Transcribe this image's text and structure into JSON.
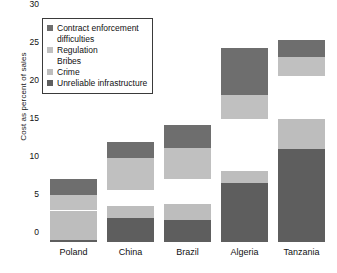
{
  "chart_data": {
    "type": "bar",
    "subtype": "stacked-bar",
    "title": "",
    "xlabel": "",
    "ylabel": "Cost as percent of sales",
    "ylim": [
      0,
      30
    ],
    "yticks": [
      0,
      5,
      10,
      15,
      20,
      25,
      30
    ],
    "grid": false,
    "legend_position": "upper-left-inside",
    "categories": [
      "Poland",
      "China",
      "Brazil",
      "Algeria",
      "Tanzania"
    ],
    "series": [
      {
        "name": "Contract enforcement difficulties",
        "color": "#6e6e6e",
        "values": [
          2.1,
          2.0,
          3.0,
          6.2,
          2.3
        ]
      },
      {
        "name": "Regulation",
        "color": "#c0c0c0",
        "values": [
          2.1,
          4.2,
          4.1,
          3.1,
          2.5
        ]
      },
      {
        "name": "Bribes",
        "color": "#ffffff",
        "values": [
          0,
          0,
          0,
          0,
          0
        ]
      },
      {
        "name": "Crime",
        "color": "#bdbdbd",
        "values": [
          3.8,
          1.7,
          2.1,
          1.5,
          3.9
        ]
      },
      {
        "name": "Unreliable infrastructure",
        "color": "#5e5e5e",
        "values": [
          0.3,
          3.1,
          2.9,
          7.8,
          12.3
        ]
      }
    ],
    "stack_tops": {
      "Poland": {
        "infra": 0.3,
        "crime": 4.1,
        "gap_top": 4.2,
        "regulation": 6.2,
        "contract": 8.3
      },
      "China": {
        "infra": 3.1,
        "crime": 4.8,
        "gap_top": 6.9,
        "regulation": 11.1,
        "contract": 13.1
      },
      "Brazil": {
        "infra": 2.9,
        "crime": 5.0,
        "gap_top": 8.3,
        "regulation": 12.4,
        "contract": 15.4
      },
      "Algeria": {
        "infra": 7.8,
        "crime": 9.3,
        "gap_top": 16.2,
        "regulation": 19.3,
        "contract": 25.5
      },
      "Tanzania": {
        "infra": 12.3,
        "crime": 16.2,
        "gap_top": 21.8,
        "regulation": 24.3,
        "contract": 26.6
      }
    },
    "totals": [
      8.3,
      13.1,
      15.4,
      25.5,
      26.6
    ]
  },
  "legend": {
    "entries": [
      {
        "label": "Contract enforcement",
        "swatch": "#6e6e6e",
        "has_swatch": true
      },
      {
        "label": "difficulties",
        "swatch": "",
        "has_swatch": false
      },
      {
        "label": "Regulation",
        "swatch": "#c0c0c0",
        "has_swatch": true
      },
      {
        "label": "Bribes",
        "swatch": "",
        "has_swatch": false
      },
      {
        "label": "Crime",
        "swatch": "#bdbdbd",
        "has_swatch": true
      },
      {
        "label": "Unreliable infrastructure",
        "swatch": "#5e5e5e",
        "has_swatch": true
      }
    ]
  },
  "axis": {
    "y_title": "Cost as percent of sales",
    "y_tick_labels": [
      "30",
      "25",
      "20",
      "15",
      "10",
      "5",
      "0"
    ],
    "x_tick_labels": [
      "Poland",
      "China",
      "Brazil",
      "Algeria",
      "Tanzania"
    ]
  },
  "colors": {
    "dark": "#6e6e6e",
    "dark2": "#5e5e5e",
    "light": "#c0c0c0",
    "light2": "#bdbdbd",
    "background": "#ffffff",
    "text": "#111111",
    "legend_border": "#3a3a3a"
  }
}
